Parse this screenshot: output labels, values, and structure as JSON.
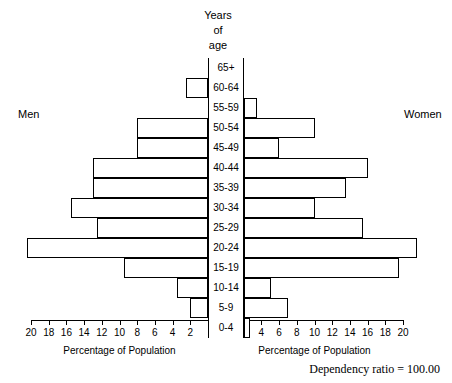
{
  "figure": {
    "title_lines": [
      "Years",
      "of",
      "age"
    ],
    "men_label": "Men",
    "women_label": "Women",
    "axis_caption_left": "Percentage of Population",
    "axis_caption_right": "Percentage of Population",
    "dependency_ratio_text": "Dependency ratio = 100.00"
  },
  "chart_data": {
    "type": "bar",
    "subtype": "population-pyramid",
    "title": "Years of age",
    "xlabel": "Percentage of Population",
    "ylabel": "Years of age",
    "categories": [
      "65+",
      "60-64",
      "55-59",
      "50-54",
      "45-49",
      "40-44",
      "35-39",
      "30-34",
      "25-29",
      "20-24",
      "15-19",
      "10-14",
      "5-9",
      "0-4"
    ],
    "series": [
      {
        "name": "Men",
        "side": "left",
        "values": [
          0.0,
          2.5,
          0.0,
          8.0,
          8.0,
          13.0,
          13.0,
          15.5,
          12.5,
          20.5,
          9.5,
          3.5,
          2.0,
          0.0
        ]
      },
      {
        "name": "Women",
        "side": "right",
        "values": [
          0.0,
          0.0,
          1.5,
          8.0,
          4.0,
          14.0,
          11.5,
          8.0,
          13.5,
          19.5,
          17.5,
          3.0,
          5.0,
          0.7
        ]
      }
    ],
    "xlim": [
      0,
      20
    ],
    "xticks_left": [
      20,
      18,
      16,
      14,
      12,
      10,
      8,
      6,
      4,
      2
    ],
    "xticks_right": [
      2,
      4,
      6,
      8,
      10,
      12,
      14,
      16,
      18,
      20
    ],
    "grid": false,
    "legend": "none",
    "annotations": [
      "Men",
      "Women",
      "Dependency ratio = 100.00"
    ]
  }
}
